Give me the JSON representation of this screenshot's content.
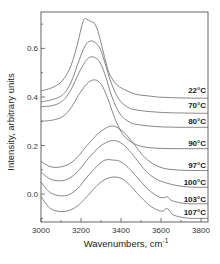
{
  "chart_data": {
    "type": "line",
    "title": "",
    "xlabel": "Wavenumbers, cm",
    "xlabel_superscript": "-1",
    "ylabel": "Intensity, arbitrary units",
    "xlim": [
      3000,
      3835
    ],
    "ylim": [
      -0.115,
      0.75
    ],
    "xticks": [
      3000,
      3200,
      3400,
      3600,
      3800
    ],
    "xtick_labels": [
      "3000",
      "3200",
      "3400",
      "3600",
      "3800"
    ],
    "yticks": [
      0.0,
      0.2,
      0.4,
      0.6
    ],
    "ytick_labels": [
      "0.0",
      "0.2",
      "0.4",
      "0.6"
    ],
    "grid": false,
    "legend": "inline labels at right end of each curve",
    "series": [
      {
        "name": "22°C",
        "label_y": 0.43,
        "x": [
          3000,
          3060,
          3110,
          3150,
          3180,
          3200,
          3215,
          3230,
          3250,
          3265,
          3285,
          3310,
          3340,
          3380,
          3430,
          3480,
          3530,
          3580,
          3630,
          3700,
          3780,
          3835
        ],
        "y": [
          0.425,
          0.44,
          0.47,
          0.53,
          0.61,
          0.68,
          0.72,
          0.72,
          0.71,
          0.705,
          0.67,
          0.59,
          0.5,
          0.45,
          0.425,
          0.41,
          0.405,
          0.4,
          0.398,
          0.396,
          0.395,
          0.395
        ]
      },
      {
        "name": "70°C",
        "label_y": 0.365,
        "x": [
          3000,
          3060,
          3110,
          3150,
          3190,
          3220,
          3245,
          3270,
          3295,
          3320,
          3350,
          3390,
          3440,
          3490,
          3540,
          3590,
          3640,
          3700,
          3780,
          3835
        ],
        "y": [
          0.38,
          0.39,
          0.41,
          0.46,
          0.55,
          0.61,
          0.63,
          0.625,
          0.6,
          0.54,
          0.46,
          0.39,
          0.355,
          0.345,
          0.34,
          0.337,
          0.335,
          0.334,
          0.333,
          0.333
        ]
      },
      {
        "name": "80°C",
        "label_y": 0.3,
        "x": [
          3000,
          3060,
          3110,
          3150,
          3190,
          3225,
          3250,
          3275,
          3300,
          3325,
          3355,
          3395,
          3445,
          3495,
          3545,
          3595,
          3645,
          3700,
          3780,
          3835
        ],
        "y": [
          0.36,
          0.365,
          0.385,
          0.43,
          0.5,
          0.55,
          0.565,
          0.56,
          0.535,
          0.48,
          0.4,
          0.33,
          0.295,
          0.285,
          0.28,
          0.277,
          0.276,
          0.275,
          0.275,
          0.275
        ]
      },
      {
        "name": "90°C",
        "label_y": 0.21,
        "x": [
          3000,
          3060,
          3110,
          3150,
          3190,
          3230,
          3260,
          3285,
          3310,
          3340,
          3370,
          3410,
          3460,
          3510,
          3560,
          3610,
          3660,
          3720,
          3780,
          3835
        ],
        "y": [
          0.3,
          0.305,
          0.32,
          0.355,
          0.41,
          0.455,
          0.47,
          0.465,
          0.44,
          0.38,
          0.31,
          0.245,
          0.21,
          0.195,
          0.19,
          0.188,
          0.187,
          0.187,
          0.187,
          0.187
        ]
      },
      {
        "name": "97°C",
        "label_y": 0.12,
        "x": [
          3000,
          3040,
          3080,
          3130,
          3180,
          3230,
          3280,
          3320,
          3350,
          3380,
          3420,
          3470,
          3520,
          3570,
          3620,
          3670,
          3720,
          3780,
          3835
        ],
        "y": [
          0.135,
          0.115,
          0.11,
          0.12,
          0.15,
          0.2,
          0.245,
          0.27,
          0.28,
          0.275,
          0.25,
          0.2,
          0.15,
          0.12,
          0.105,
          0.1,
          0.098,
          0.097,
          0.097
        ]
      },
      {
        "name": "100°C",
        "label_y": 0.05,
        "x": [
          3000,
          3040,
          3080,
          3130,
          3180,
          3230,
          3280,
          3320,
          3355,
          3390,
          3430,
          3480,
          3530,
          3580,
          3630,
          3680,
          3730,
          3780,
          3835
        ],
        "y": [
          0.09,
          0.065,
          0.055,
          0.06,
          0.09,
          0.14,
          0.185,
          0.21,
          0.22,
          0.215,
          0.19,
          0.14,
          0.09,
          0.06,
          0.045,
          0.035,
          0.03,
          0.028,
          0.028
        ]
      },
      {
        "name": "103°C",
        "label_y": -0.02,
        "x": [
          3000,
          3040,
          3080,
          3130,
          3180,
          3230,
          3280,
          3320,
          3360,
          3395,
          3435,
          3485,
          3535,
          3585,
          3615,
          3630,
          3650,
          3690,
          3740,
          3790,
          3835
        ],
        "y": [
          0.05,
          0.01,
          -0.005,
          -0.005,
          0.02,
          0.07,
          0.115,
          0.14,
          0.14,
          0.135,
          0.11,
          0.065,
          0.02,
          -0.01,
          -0.015,
          -0.01,
          -0.025,
          -0.035,
          -0.04,
          -0.04,
          -0.04
        ]
      },
      {
        "name": "107°C",
        "label_y": -0.075,
        "x": [
          3000,
          3040,
          3080,
          3130,
          3180,
          3230,
          3280,
          3320,
          3360,
          3400,
          3440,
          3490,
          3540,
          3580,
          3610,
          3625,
          3640,
          3660,
          3700,
          3750,
          3800,
          3835
        ],
        "y": [
          -0.01,
          -0.055,
          -0.07,
          -0.07,
          -0.05,
          -0.01,
          0.035,
          0.06,
          0.07,
          0.065,
          0.04,
          -0.005,
          -0.045,
          -0.065,
          -0.07,
          -0.06,
          -0.065,
          -0.085,
          -0.095,
          -0.1,
          -0.1,
          -0.1
        ]
      }
    ]
  }
}
